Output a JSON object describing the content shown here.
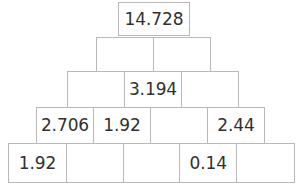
{
  "diagram": {
    "type": "number-pyramid",
    "title": "",
    "row_count": 5,
    "colors": {
      "cell_background": "#ffffff",
      "cell_border": "#b9b9b9",
      "text": "#303030",
      "page_background": "#ffffff"
    },
    "rows": [
      {
        "index": 0,
        "cell_count": 1,
        "cells": [
          {
            "value": "14.728",
            "filled": true
          }
        ]
      },
      {
        "index": 1,
        "cell_count": 2,
        "cells": [
          {
            "value": "",
            "filled": false
          },
          {
            "value": "",
            "filled": false
          }
        ]
      },
      {
        "index": 2,
        "cell_count": 3,
        "cells": [
          {
            "value": "",
            "filled": false
          },
          {
            "value": "3.194",
            "filled": true
          },
          {
            "value": "",
            "filled": false
          }
        ]
      },
      {
        "index": 3,
        "cell_count": 4,
        "cells": [
          {
            "value": "2.706",
            "filled": true
          },
          {
            "value": "1.92",
            "filled": true
          },
          {
            "value": "",
            "filled": false
          },
          {
            "value": "2.44",
            "filled": true
          }
        ]
      },
      {
        "index": 4,
        "cell_count": 5,
        "cells": [
          {
            "value": "1.92",
            "filled": true
          },
          {
            "value": "",
            "filled": false
          },
          {
            "value": "",
            "filled": false
          },
          {
            "value": "0.14",
            "filled": true
          },
          {
            "value": "",
            "filled": false
          }
        ]
      }
    ]
  }
}
